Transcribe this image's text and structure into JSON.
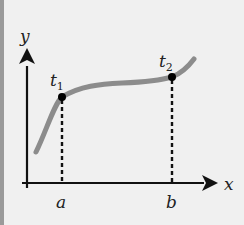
{
  "diagram": {
    "axes": {
      "x_label": "x",
      "y_label": "y"
    },
    "points": [
      {
        "label": "t",
        "subscript": "1",
        "axis_label": "a"
      },
      {
        "label": "t",
        "subscript": "2",
        "axis_label": "b"
      }
    ],
    "colors": {
      "background": "#f0f0f0",
      "left_strip": "#9a9a9a",
      "axis": "#111111",
      "curve": "#8c8c8c",
      "point": "#000000",
      "dashed": "#111111"
    }
  }
}
